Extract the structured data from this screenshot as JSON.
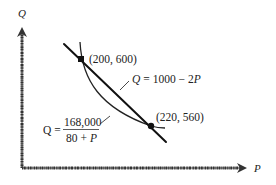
{
  "diagram": {
    "axes": {
      "y_label": "Q",
      "x_label": "P"
    },
    "linear_demand": {
      "equation_lhs": "Q",
      "equation_rhs": "= 1000 − 2",
      "equation_var": "P",
      "intercept": 1000,
      "slope": -2
    },
    "hyperbolic_demand": {
      "equation_lhs": "Q =",
      "numerator": "168,000",
      "denominator_const": "80 +",
      "denominator_var": "P",
      "constant": 168000,
      "offset": 80
    },
    "points": [
      {
        "label": "(200, 600)",
        "P": 200,
        "Q": 600
      },
      {
        "label": "(220, 560)",
        "P": 220,
        "Q": 560
      }
    ]
  }
}
